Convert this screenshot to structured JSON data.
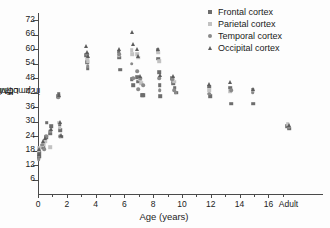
{
  "chart_data": {
    "type": "scatter",
    "title": "",
    "xlabel": "Age (years)",
    "ylabel": "LCMR_glc in µmol/min/100g",
    "ylabel_main": "LCMR",
    "ylabel_sub": "glc",
    "ylabel_rest": " in µmol/min/100g",
    "xlim": [
      0,
      17.5
    ],
    "ylim": [
      0,
      75
    ],
    "xticks": [
      "0",
      "2",
      "4",
      "6",
      "8",
      "10",
      "12",
      "14",
      "16",
      "Adult"
    ],
    "xtick_values": [
      0,
      2,
      4,
      6,
      8,
      10,
      12,
      14,
      16,
      17.4
    ],
    "yticks": [
      "6",
      "12",
      "18",
      "24",
      "30",
      "36",
      "42",
      "48",
      "54",
      "60",
      "66",
      "72"
    ],
    "ytick_values": [
      6,
      12,
      18,
      24,
      30,
      36,
      42,
      48,
      54,
      60,
      66,
      72
    ],
    "grid": false,
    "legend_position": "top-right",
    "legend": [
      {
        "name": "Frontal cortex",
        "marker": "square",
        "color": "#6d6d6d"
      },
      {
        "name": "Parietal cortex",
        "marker": "square",
        "color": "#c2c2c2"
      },
      {
        "name": "Temporal cortex",
        "marker": "circle",
        "color": "#8a8a8a"
      },
      {
        "name": "Occipital cortex",
        "marker": "triangle",
        "color": "#5c5c5c"
      }
    ],
    "series": [
      {
        "name": "Frontal cortex",
        "marker": "square",
        "color": "#6d6d6d",
        "points": [
          [
            0.05,
            15.0
          ],
          [
            0.05,
            16.2
          ],
          [
            0.08,
            17.0
          ],
          [
            0.1,
            15.5
          ],
          [
            0.35,
            19.5
          ],
          [
            0.4,
            21.0
          ],
          [
            0.55,
            23.5
          ],
          [
            0.6,
            29.5
          ],
          [
            0.85,
            25.0
          ],
          [
            0.9,
            28.0
          ],
          [
            1.4,
            40.5
          ],
          [
            1.45,
            41.5
          ],
          [
            1.5,
            29.0
          ],
          [
            1.55,
            26.5
          ],
          [
            1.6,
            23.8
          ],
          [
            3.35,
            57.5
          ],
          [
            3.4,
            54.5
          ],
          [
            3.45,
            52.0
          ],
          [
            5.6,
            59.0
          ],
          [
            5.65,
            56.5
          ],
          [
            5.7,
            51.5
          ],
          [
            6.5,
            47.5
          ],
          [
            6.6,
            45.0
          ],
          [
            6.9,
            48.5
          ],
          [
            6.95,
            46.5
          ],
          [
            7.25,
            41.0
          ],
          [
            7.3,
            41.0
          ],
          [
            8.3,
            59.5
          ],
          [
            8.35,
            56.0
          ],
          [
            8.4,
            50.5
          ],
          [
            8.45,
            45.0
          ],
          [
            8.5,
            40.5
          ],
          [
            9.3,
            48.0
          ],
          [
            9.4,
            46.0
          ],
          [
            9.5,
            44.0
          ],
          [
            9.6,
            42.0
          ],
          [
            11.9,
            44.5
          ],
          [
            11.95,
            40.5
          ],
          [
            13.35,
            44.0
          ],
          [
            13.4,
            37.5
          ],
          [
            14.9,
            43.0
          ],
          [
            14.95,
            37.5
          ],
          [
            17.3,
            28.0
          ],
          [
            17.45,
            27.0
          ]
        ]
      },
      {
        "name": "Parietal cortex",
        "marker": "square",
        "color": "#c2c2c2",
        "points": [
          [
            0.05,
            18.0
          ],
          [
            0.08,
            19.0
          ],
          [
            0.3,
            20.0
          ],
          [
            0.38,
            20.5
          ],
          [
            0.5,
            22.0
          ],
          [
            0.85,
            19.5
          ],
          [
            1.45,
            29.5
          ],
          [
            1.5,
            27.5
          ],
          [
            3.4,
            56.0
          ],
          [
            3.45,
            55.0
          ],
          [
            5.6,
            57.5
          ],
          [
            6.5,
            59.5
          ],
          [
            6.55,
            58.0
          ],
          [
            6.9,
            58.0
          ],
          [
            6.95,
            56.5
          ],
          [
            7.1,
            47.5
          ],
          [
            7.15,
            46.0
          ],
          [
            8.35,
            58.5
          ],
          [
            8.4,
            55.0
          ],
          [
            9.35,
            48.0
          ],
          [
            9.45,
            46.5
          ],
          [
            11.9,
            43.0
          ],
          [
            13.35,
            42.5
          ],
          [
            14.9,
            42.5
          ],
          [
            17.35,
            29.0
          ]
        ]
      },
      {
        "name": "Temporal cortex",
        "marker": "circle",
        "color": "#8a8a8a",
        "points": [
          [
            0.05,
            14.5
          ],
          [
            0.06,
            16.0
          ],
          [
            0.3,
            20.5
          ],
          [
            0.45,
            18.5
          ],
          [
            0.55,
            24.0
          ],
          [
            0.85,
            26.0
          ],
          [
            1.4,
            40.0
          ],
          [
            1.5,
            24.0
          ],
          [
            3.4,
            58.0
          ],
          [
            3.45,
            53.0
          ],
          [
            5.65,
            58.0
          ],
          [
            6.5,
            54.0
          ],
          [
            6.6,
            48.0
          ],
          [
            6.9,
            51.0
          ],
          [
            6.95,
            43.5
          ],
          [
            7.1,
            48.0
          ],
          [
            7.3,
            45.0
          ],
          [
            8.4,
            48.0
          ],
          [
            8.45,
            43.0
          ],
          [
            9.3,
            47.5
          ],
          [
            9.45,
            43.0
          ],
          [
            9.55,
            42.0
          ],
          [
            11.9,
            41.5
          ],
          [
            13.4,
            43.0
          ],
          [
            14.9,
            42.0
          ],
          [
            17.4,
            27.5
          ]
        ]
      },
      {
        "name": "Occipital cortex",
        "marker": "triangle",
        "color": "#5c5c5c",
        "points": [
          [
            0.06,
            16.5
          ],
          [
            0.1,
            18.5
          ],
          [
            0.35,
            22.0
          ],
          [
            0.5,
            23.0
          ],
          [
            0.9,
            27.0
          ],
          [
            1.45,
            41.0
          ],
          [
            1.5,
            30.0
          ],
          [
            1.6,
            24.5
          ],
          [
            3.35,
            61.5
          ],
          [
            3.4,
            59.0
          ],
          [
            3.45,
            57.0
          ],
          [
            5.6,
            60.0
          ],
          [
            6.5,
            67.0
          ],
          [
            6.6,
            62.0
          ],
          [
            6.9,
            60.0
          ],
          [
            6.95,
            57.0
          ],
          [
            7.1,
            49.0
          ],
          [
            8.35,
            60.0
          ],
          [
            8.45,
            49.5
          ],
          [
            9.35,
            49.0
          ],
          [
            11.9,
            45.5
          ],
          [
            13.35,
            46.5
          ],
          [
            14.9,
            43.5
          ],
          [
            17.45,
            28.5
          ]
        ]
      }
    ]
  }
}
